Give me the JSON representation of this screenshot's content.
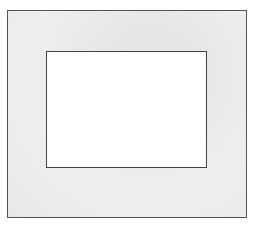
{
  "figure": {
    "type": "frame-within-frame",
    "colors": {
      "outer_fill": "#ebebeb",
      "outer_border": "#555555",
      "inner_fill": "#ffffff",
      "inner_border": "#444444"
    }
  }
}
